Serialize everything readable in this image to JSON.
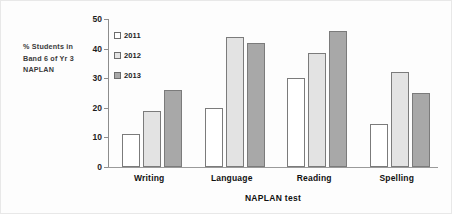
{
  "chart_data": {
    "type": "bar",
    "title": "",
    "categories": [
      "Writing",
      "Language",
      "Reading",
      "Spelling"
    ],
    "series": [
      {
        "name": "2011",
        "values": [
          11,
          20,
          30,
          14.5
        ],
        "color": "#ffffff"
      },
      {
        "name": "2012",
        "values": [
          19,
          44,
          38.5,
          32
        ],
        "color": "#e3e3e3"
      },
      {
        "name": "2013",
        "values": [
          26,
          42,
          46,
          25
        ],
        "color": "#a8a8a8"
      }
    ],
    "xlabel": "NAPLAN test",
    "ylabel": "% Students in Band 6 of Yr 3 NAPLAN",
    "ylim": [
      0,
      50
    ],
    "yticks": [
      0,
      10,
      20,
      30,
      40,
      50
    ],
    "ytick_labels": [
      "0",
      "10",
      "20",
      "30",
      "40",
      "50"
    ],
    "grid": false,
    "legend_position": "upper-left-inside"
  },
  "axis_caption": {
    "line1": "% Students in",
    "line2": "Band 6 of Yr 3",
    "line3": "NAPLAN"
  },
  "x_axis": {
    "title": "NAPLAN test"
  },
  "legend": {
    "items": [
      {
        "label": "2011"
      },
      {
        "label": "2012"
      },
      {
        "label": "2013"
      }
    ]
  }
}
